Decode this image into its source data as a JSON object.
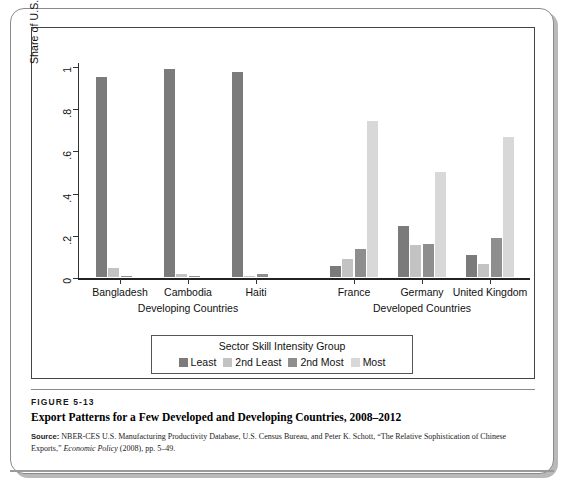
{
  "figure": {
    "number": "FIGURE 5-13",
    "title": "Export Patterns for a Few Developed and Developing Countries, 2008–2012",
    "source_label": "Source:",
    "source_text_1": " NBER-CES U.S. Manufacturing Productivity Database, U.S. Census Bureau, and Peter K. Schott, “The Relative Sophistication of Chinese Exports,” ",
    "source_italic": "Economic Policy",
    "source_text_2": " (2008), pp. 5–49."
  },
  "legend": {
    "title": "Sector Skill Intensity Group",
    "items": [
      {
        "label": "Least",
        "color": "#7b7b7b"
      },
      {
        "label": "2nd Least",
        "color": "#c3c3c3"
      },
      {
        "label": "2nd Most",
        "color": "#8e8e8e"
      },
      {
        "label": "Most",
        "color": "#d8d8d8"
      }
    ]
  },
  "chart_data": {
    "type": "bar",
    "title": "Export Patterns for a Few Developed and Developing Countries, 2008–2012",
    "xlabel": "",
    "ylabel": "Share of U.S. Imports by Sector",
    "ylim": [
      0,
      1
    ],
    "yticks": [
      "0",
      ".2",
      ".4",
      ".6",
      ".8",
      "1"
    ],
    "ytick_values": [
      0,
      0.2,
      0.4,
      0.6,
      0.8,
      1
    ],
    "grid": false,
    "legend_position": "below-axes",
    "group_labels": [
      "Developing Countries",
      "Developed Countries"
    ],
    "categories": [
      "Bangladesh",
      "Cambodia",
      "Haiti",
      "France",
      "Germany",
      "United Kingdom"
    ],
    "series": [
      {
        "name": "Least",
        "color": "#7b7b7b",
        "values": [
          0.95,
          0.985,
          0.97,
          0.05,
          0.24,
          0.105
        ]
      },
      {
        "name": "2nd Least",
        "color": "#c3c3c3",
        "values": [
          0.045,
          0.012,
          0.005,
          0.085,
          0.15,
          0.06
        ]
      },
      {
        "name": "2nd Most",
        "color": "#8e8e8e",
        "values": [
          0.005,
          0.003,
          0.012,
          0.135,
          0.155,
          0.185
        ]
      },
      {
        "name": "Most",
        "color": "#d8d8d8",
        "values": [
          0.0,
          0.0,
          0.0,
          0.74,
          0.5,
          0.665
        ]
      }
    ]
  }
}
